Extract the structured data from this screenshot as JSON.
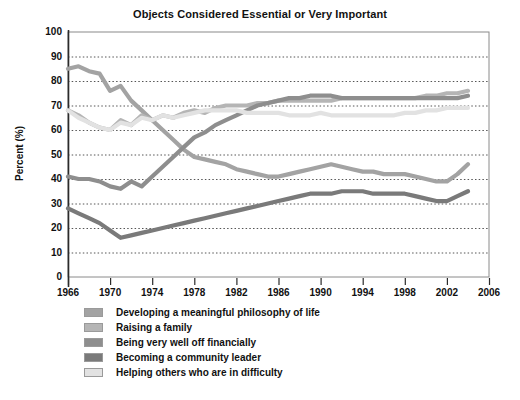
{
  "chart_data": {
    "type": "line",
    "title": "Objects Considered Essential or Very Important",
    "xlabel": "",
    "ylabel": "Percent (%)",
    "xlim": [
      1966,
      2006
    ],
    "ylim": [
      0,
      100
    ],
    "grid": true,
    "grid_orientation": "horizontal",
    "grid_style": "dotted",
    "legend_position": "below",
    "x_ticks": [
      1966,
      1970,
      1974,
      1978,
      1982,
      1986,
      1990,
      1994,
      1998,
      2002,
      2006
    ],
    "y_ticks": [
      0,
      10,
      20,
      30,
      40,
      50,
      60,
      70,
      80,
      90,
      100
    ],
    "x": [
      1966,
      1967,
      1968,
      1969,
      1970,
      1971,
      1972,
      1973,
      1974,
      1975,
      1976,
      1977,
      1978,
      1979,
      1980,
      1981,
      1982,
      1983,
      1984,
      1985,
      1986,
      1987,
      1988,
      1989,
      1990,
      1991,
      1992,
      1993,
      1994,
      1995,
      1996,
      1997,
      1998,
      1999,
      2000,
      2001,
      2002,
      2003,
      2004
    ],
    "series": [
      {
        "name": "Developing a meaningful philosophy of life",
        "color": "#a3a3a3",
        "values": [
          85,
          86,
          84,
          83,
          76,
          78,
          72,
          68,
          64,
          60,
          56,
          52,
          49,
          48,
          47,
          46,
          44,
          43,
          42,
          41,
          41,
          42,
          43,
          44,
          45,
          46,
          45,
          44,
          43,
          43,
          42,
          42,
          42,
          41,
          40,
          39,
          39,
          42,
          46
        ]
      },
      {
        "name": "Raising a family",
        "color": "#b5b5b5",
        "values": [
          68,
          66,
          63,
          61,
          60,
          64,
          62,
          66,
          64,
          66,
          65,
          67,
          68,
          67,
          69,
          70,
          70,
          70,
          71,
          71,
          72,
          72,
          72,
          72,
          72,
          72,
          73,
          73,
          73,
          73,
          73,
          73,
          73,
          73,
          74,
          74,
          75,
          75,
          76
        ]
      },
      {
        "name": "Being very well off financially",
        "color": "#8e8e8e",
        "values": [
          41,
          40,
          40,
          39,
          37,
          36,
          39,
          37,
          41,
          45,
          49,
          53,
          57,
          59,
          62,
          64,
          66,
          68,
          70,
          71,
          72,
          73,
          73,
          74,
          74,
          74,
          73,
          73,
          73,
          73,
          73,
          73,
          73,
          73,
          73,
          73,
          73,
          73,
          74
        ]
      },
      {
        "name": "Becoming a community leader",
        "color": "#7a7a7a",
        "values": [
          28,
          26,
          24,
          22,
          19,
          16,
          17,
          18,
          19,
          20,
          21,
          22,
          23,
          24,
          25,
          26,
          27,
          28,
          29,
          30,
          31,
          32,
          33,
          34,
          34,
          34,
          35,
          35,
          35,
          34,
          34,
          34,
          34,
          33,
          32,
          31,
          31,
          33,
          35
        ]
      },
      {
        "name": "Helping others who are in difficulty",
        "color": "#e2e2e2",
        "values": [
          68,
          65,
          63,
          61,
          60,
          63,
          62,
          65,
          64,
          66,
          65,
          66,
          67,
          68,
          68,
          68,
          68,
          67,
          67,
          67,
          67,
          66,
          66,
          66,
          67,
          66,
          66,
          66,
          66,
          66,
          66,
          66,
          67,
          67,
          68,
          68,
          69,
          69,
          69
        ]
      }
    ]
  },
  "axis": {
    "y_title": "Percent (%)",
    "y_tick_labels": [
      "100",
      "90",
      "80",
      "70",
      "60",
      "50",
      "40",
      "30",
      "20",
      "10",
      "0"
    ],
    "x_tick_labels": [
      "1966",
      "1970",
      "1974",
      "1978",
      "1982",
      "1986",
      "1990",
      "1994",
      "1998",
      "2002",
      "2006"
    ]
  },
  "legend": {
    "items": [
      {
        "label": "Developing a meaningful philosophy of life",
        "color": "#a3a3a3"
      },
      {
        "label": "Raising a family",
        "color": "#b5b5b5"
      },
      {
        "label": "Being very well off financially",
        "color": "#8e8e8e"
      },
      {
        "label": "Becoming a community leader",
        "color": "#7a7a7a"
      },
      {
        "label": "Helping others who are in difficulty",
        "color": "#e2e2e2"
      }
    ]
  }
}
